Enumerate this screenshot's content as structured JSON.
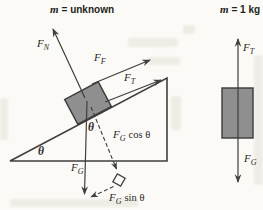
{
  "figure": {
    "left": {
      "title": {
        "variable": "m",
        "rest": "= unknown"
      },
      "angle_base": "θ",
      "angle_block": "θ",
      "forces": {
        "normal": {
          "symbol": "F",
          "subscript": "N"
        },
        "friction": {
          "symbol": "F",
          "subscript": "F"
        },
        "tension": {
          "symbol": "F",
          "subscript": "T"
        },
        "gravity": {
          "symbol": "F",
          "subscript": "G"
        },
        "gravity_cos": {
          "symbol": "F",
          "subscript": "G",
          "rest": "cos θ"
        },
        "gravity_sin": {
          "symbol": "F",
          "subscript": "G",
          "rest": "sin θ"
        }
      }
    },
    "right": {
      "title": {
        "variable": "m",
        "rest": "= 1 kg"
      },
      "forces": {
        "tension": {
          "symbol": "F",
          "subscript": "T"
        },
        "gravity": {
          "symbol": "F",
          "subscript": "G"
        }
      }
    },
    "colors": {
      "line": "#3f3f3f",
      "block_fill": "#8f8f8f",
      "block_stroke": "#3a3a3a",
      "background": "#fbfaf6",
      "text": "#2b2926"
    }
  }
}
